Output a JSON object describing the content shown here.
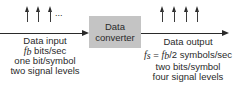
{
  "box": {
    "line1": "Data",
    "line2": "converter",
    "fill": "#c4c4c4"
  },
  "input": {
    "title": "Data input",
    "rate_symbol": "f",
    "rate_sub": "b",
    "rate_unit": " bits/sec",
    "bits_per_symbol": "one bit/symbol",
    "levels": "two signal levels",
    "pulse_arrows": 3,
    "ellipsis": "..."
  },
  "output": {
    "title": "Data output",
    "rate_lhs": "f",
    "rate_lhs_sub": "s",
    "rate_eq": " = ",
    "rate_rhs": "f",
    "rate_rhs_sub": "b",
    "rate_unit": "/2 symbols/sec",
    "bits_per_symbol": "two bits/symbol",
    "levels": "four signal levels",
    "pulse_arrows": 4
  }
}
